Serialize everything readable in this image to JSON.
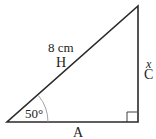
{
  "diagram": {
    "type": "right-triangle",
    "hypotenuse": {
      "label": "H",
      "length": "8 cm"
    },
    "opposite": {
      "label": "C",
      "variable": "x"
    },
    "adjacent": {
      "label": "A"
    },
    "angle": {
      "value": "50°"
    },
    "right_angle_marker": true
  }
}
